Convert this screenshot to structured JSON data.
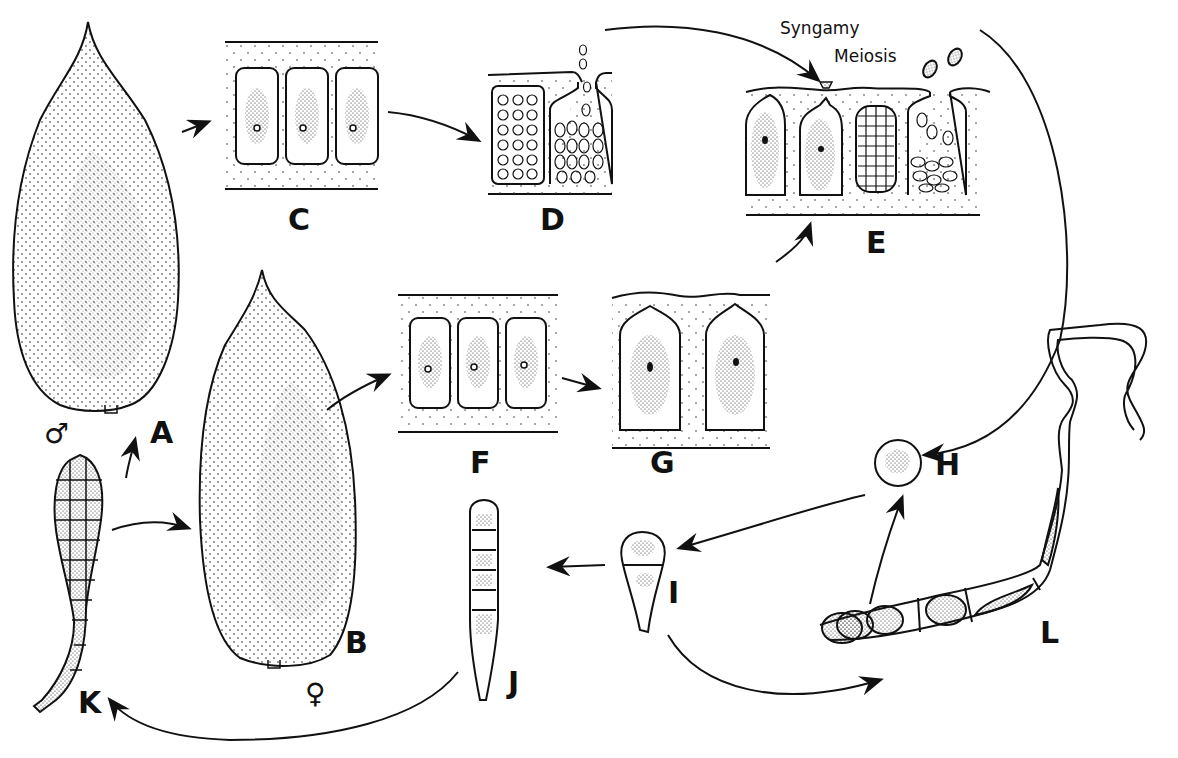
{
  "diagram": {
    "type": "life-cycle",
    "stages": [
      {
        "id": "A",
        "label": "A",
        "description": "male blade (gametophyte)",
        "symbol": "♂"
      },
      {
        "id": "B",
        "label": "B",
        "description": "female blade (gametophyte)",
        "symbol": "♀"
      },
      {
        "id": "C",
        "label": "C",
        "description": "vegetative cells of male blade"
      },
      {
        "id": "D",
        "label": "D",
        "description": "spermatangia releasing spermatia"
      },
      {
        "id": "E",
        "label": "E",
        "description": "carpogonia, fertilization, carposporangia releasing carpospores"
      },
      {
        "id": "F",
        "label": "F",
        "description": "vegetative cells of female blade"
      },
      {
        "id": "G",
        "label": "G",
        "description": "carpogonia"
      },
      {
        "id": "H",
        "label": "H",
        "description": "spore"
      },
      {
        "id": "I",
        "label": "I",
        "description": "germling"
      },
      {
        "id": "J",
        "label": "J",
        "description": "young multicellular germling"
      },
      {
        "id": "K",
        "label": "K",
        "description": "young blade"
      },
      {
        "id": "L",
        "label": "L",
        "description": "filamentous conchocelis phase"
      }
    ],
    "annotations": {
      "syngamy": "Syngamy",
      "meiosis": "Meiosis"
    },
    "symbols": {
      "male": "♂",
      "female": "♀"
    },
    "colors": {
      "ink": "#111111",
      "background": "#ffffff"
    }
  }
}
